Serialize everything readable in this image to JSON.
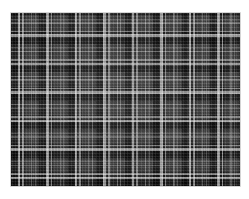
{
  "image": {
    "subject": "plaid-fabric-swatch",
    "description": "Black, white and grey plaid (tartan) woven fabric swatch photographed flat on a white background",
    "background_color": "#ffffff",
    "canvas": {
      "width": 249,
      "height": 199
    }
  },
  "swatch": {
    "label": "plaid fabric swatch",
    "bounds": {
      "x": 11,
      "y": 13,
      "width": 229,
      "height": 173
    },
    "pattern": {
      "name": "checked plaid / tartan",
      "repeat_px": 28.5,
      "weave": "balanced even-sided check",
      "symmetry": "symmetric sett, identical warp and weft sequence"
    },
    "palette": {
      "darkest": "#141414",
      "dark": "#1f1f1f",
      "mid_grey": "#4a4a4a",
      "light_grey": "#9a9a9a",
      "highlight_white": "#e8e8e8"
    },
    "stripe_sequence": [
      {
        "name": "black-block",
        "width_px": 6.4,
        "color": "#141414"
      },
      {
        "name": "bright-white-band",
        "width_px": 2.2,
        "color": "#e8e8e8"
      },
      {
        "name": "dark-gap",
        "width_px": 2.2,
        "color": "#1f1f1f"
      },
      {
        "name": "white-band",
        "width_px": 1.6,
        "color": "#d8d8d8"
      },
      {
        "name": "grey-field",
        "width_px": 7.0,
        "color": "#4a4a4a"
      },
      {
        "name": "thin-white-line",
        "width_px": 1.2,
        "color": "#b4b4b4"
      },
      {
        "name": "grey-gap",
        "width_px": 2.4,
        "color": "#4a4a4a"
      },
      {
        "name": "thin-white-line",
        "width_px": 1.1,
        "color": "#aaaaaa"
      },
      {
        "name": "grey-field-tail",
        "width_px": 3.8,
        "color": "#4a4a4a"
      }
    ]
  }
}
